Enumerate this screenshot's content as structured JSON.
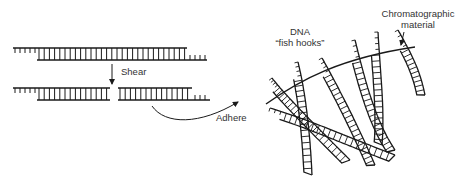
{
  "labels": {
    "shear": "Shear",
    "adhere": "Adhere",
    "dna_line1": "DNA",
    "dna_line2": "“fish hooks”",
    "chrom_line1": "Chromatographic",
    "chrom_line2": "material"
  },
  "colors": {
    "ink": "#1a1a1a",
    "text": "#333333",
    "background": "#ffffff"
  }
}
